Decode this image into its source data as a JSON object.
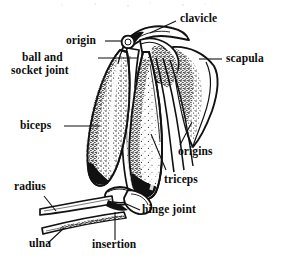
{
  "figure": {
    "style": "black-and-white stippled line engraving",
    "background_color": "#ffffff",
    "ink_color": "#111111"
  },
  "labels": {
    "clavicle": "clavicle",
    "origin": "origin",
    "ball_and_socket_joint_line1": "ball and",
    "ball_and_socket_joint_line2": "socket joint",
    "scapula": "scapula",
    "biceps": "biceps",
    "origins": "origins",
    "triceps": "triceps",
    "radius": "radius",
    "hinge_joint": "hinge joint",
    "ulna": "ulna",
    "insertion": "insertion"
  },
  "parts": [
    {
      "name": "clavicle",
      "kind": "bone",
      "label": "clavicle"
    },
    {
      "name": "scapula",
      "kind": "bone",
      "label": "scapula"
    },
    {
      "name": "humerus",
      "kind": "bone",
      "label": ""
    },
    {
      "name": "radius",
      "kind": "bone",
      "label": "radius"
    },
    {
      "name": "ulna",
      "kind": "bone",
      "label": "ulna"
    },
    {
      "name": "biceps",
      "kind": "muscle",
      "label": "biceps"
    },
    {
      "name": "triceps",
      "kind": "muscle",
      "label": "triceps"
    },
    {
      "name": "ball-and-socket-joint",
      "kind": "joint",
      "label": "ball and socket joint"
    },
    {
      "name": "hinge-joint",
      "kind": "joint",
      "label": "hinge joint"
    },
    {
      "name": "muscle-origin",
      "kind": "attachment",
      "label": "origin"
    },
    {
      "name": "muscle-origins",
      "kind": "attachment",
      "label": "origins"
    },
    {
      "name": "muscle-insertion",
      "kind": "attachment",
      "label": "insertion"
    }
  ]
}
